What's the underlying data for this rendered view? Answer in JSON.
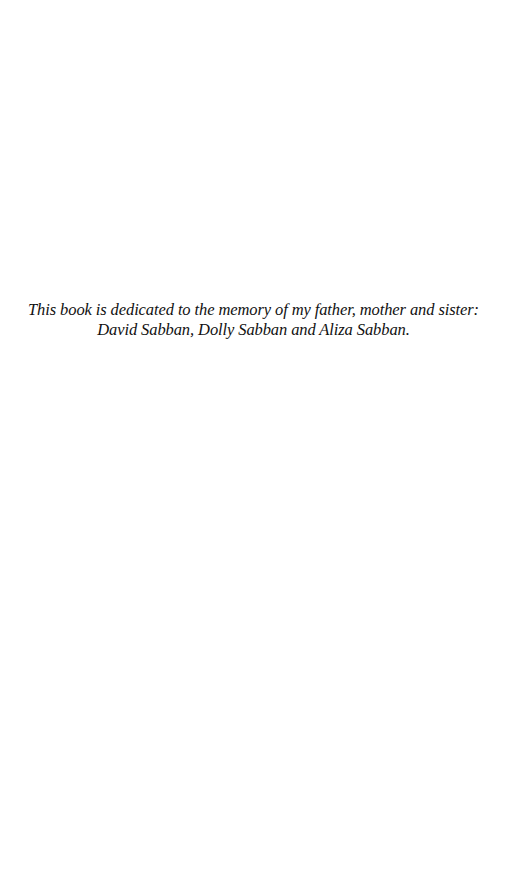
{
  "page": {
    "background": "#ffffff",
    "text_color": "#111111"
  },
  "dedication": {
    "lines": [
      "This book is dedicated to the memory of my father, mother and sister:",
      "David Sabban, Dolly Sabban and Aliza Sabban."
    ]
  }
}
